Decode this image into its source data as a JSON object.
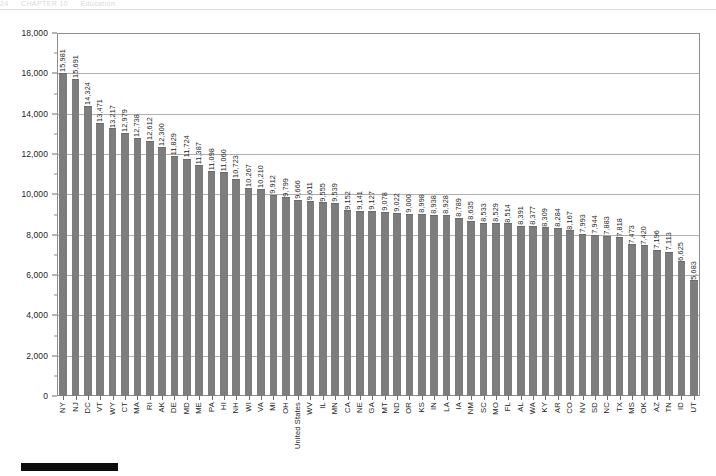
{
  "running_head": {
    "left": "24",
    "middle": "CHAPTER 10",
    "right": "Education"
  },
  "chart_data": {
    "type": "bar",
    "title": "",
    "subtitle": "",
    "xlabel": "",
    "ylabel": "",
    "ylim": [
      0,
      18000
    ],
    "ytick_interval": 2000,
    "ytick_labels": [
      "0",
      "2,000",
      "4,000",
      "6,000",
      "8,000",
      "10,000",
      "12,000",
      "14,000",
      "16,000",
      "18,000"
    ],
    "ytick_values": [
      0,
      2000,
      4000,
      6000,
      8000,
      10000,
      12000,
      14000,
      16000,
      18000
    ],
    "grid": true,
    "legend": "none",
    "bar_color": "#7d7d7d",
    "sorted": "descending",
    "categories": [
      "NY",
      "NJ",
      "DC",
      "VT",
      "WY",
      "CT",
      "MA",
      "RI",
      "AK",
      "DE",
      "MD",
      "ME",
      "PA",
      "HI",
      "NH",
      "WI",
      "VA",
      "MI",
      "OH",
      "United States",
      "WV",
      "IL",
      "MN",
      "CA",
      "NE",
      "GA",
      "MT",
      "ND",
      "OR",
      "KS",
      "IN",
      "LA",
      "IA",
      "NM",
      "SC",
      "MO",
      "FL",
      "AL",
      "WA",
      "KY",
      "AR",
      "CO",
      "NV",
      "SD",
      "NC",
      "TX",
      "MS",
      "OK",
      "AZ",
      "TN",
      "ID",
      "UT"
    ],
    "values": [
      15981,
      15691,
      14324,
      13471,
      13217,
      12979,
      12738,
      12612,
      12300,
      11829,
      11724,
      11387,
      11098,
      11060,
      10723,
      10267,
      10210,
      9912,
      9799,
      9666,
      9611,
      9555,
      9539,
      9152,
      9141,
      9127,
      9078,
      9022,
      9000,
      8998,
      8938,
      8928,
      8789,
      8635,
      8533,
      8529,
      8514,
      8391,
      8377,
      8309,
      8284,
      8167,
      7993,
      7944,
      7883,
      7818,
      7473,
      7420,
      7196,
      7113,
      6625,
      5683
    ],
    "value_labels": [
      "15,981",
      "15,691",
      "14,324",
      "13,471",
      "13,217",
      "12,979",
      "12,738",
      "12,612",
      "12,300",
      "11,829",
      "11,724",
      "11,387",
      "11,098",
      "11,060",
      "10,723",
      "10,267",
      "10,210",
      "9,912",
      "9,799",
      "9,666",
      "9,611",
      "9,555",
      "9,539",
      "9,152",
      "9,141",
      "9,127",
      "9,078",
      "9,022",
      "9,000",
      "8,998",
      "8,938",
      "8,928",
      "8,789",
      "8,635",
      "8,533",
      "8,529",
      "8,514",
      "8,391",
      "8,377",
      "8,309",
      "8,284",
      "8,167",
      "7,993",
      "7,944",
      "7,883",
      "7,818",
      "7,473",
      "7,420",
      "7,196",
      "7,113",
      "6,625",
      "5,683"
    ]
  }
}
